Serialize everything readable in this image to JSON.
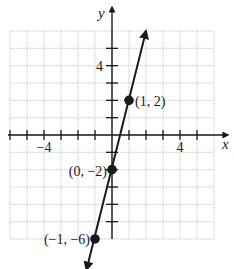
{
  "chart_data": {
    "type": "line",
    "title": "",
    "xlabel": "x",
    "ylabel": "y",
    "xlim": [
      -6,
      6
    ],
    "ylim": [
      -6,
      6
    ],
    "grid": true,
    "x_ticks": [
      -6,
      -5,
      -4,
      -3,
      -2,
      -1,
      1,
      2,
      3,
      4,
      5
    ],
    "y_ticks": [
      -5,
      -4,
      -3,
      -2,
      -1,
      1,
      2,
      3,
      4,
      5
    ],
    "x_tick_labels": [
      {
        "value": -4,
        "label": "−4"
      },
      {
        "value": 4,
        "label": "4"
      }
    ],
    "y_tick_labels": [
      {
        "value": 4,
        "label": "4"
      }
    ],
    "series": [
      {
        "name": "line",
        "equation": "y = 4x - 2",
        "slope": 4,
        "intercept": -2,
        "arrow_start": [
          -1.5,
          -8
        ],
        "arrow_end": [
          2,
          6
        ],
        "color": "#1a1a1a"
      }
    ],
    "points": [
      {
        "x": 1,
        "y": 2,
        "label": "(1, 2)"
      },
      {
        "x": 0,
        "y": -2,
        "label": "(0, −2)"
      },
      {
        "x": -1,
        "y": -6,
        "label": "(−1, −6)"
      }
    ]
  },
  "colors": {
    "grid": "#bdbdbd",
    "axis": "#1a1a1a",
    "line": "#1a1a1a",
    "background": "#ffffff"
  }
}
